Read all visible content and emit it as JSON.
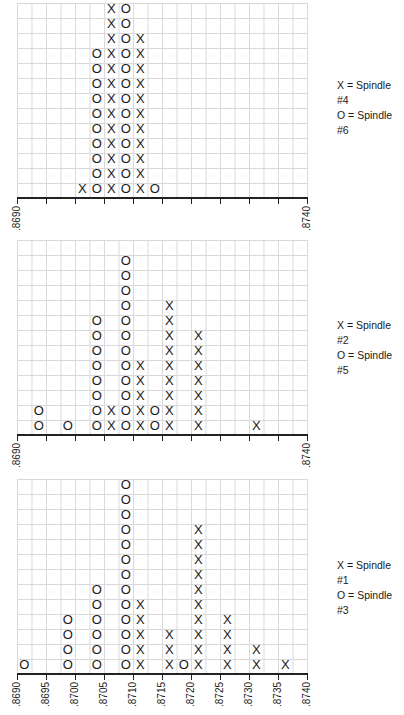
{
  "chart_data": [
    {
      "type": "scatter",
      "subtype": "dot-plot (tally of X/O markers)",
      "xlabel": "",
      "ylabel": "",
      "xlim": [
        0.869,
        0.874
      ],
      "bin_width": 0.00025,
      "legend_position": "right",
      "grid": true,
      "tick_labels": [
        ".8690",
        ".8740"
      ],
      "series": [
        {
          "name": "X = Spindle #4",
          "marker": "X",
          "bins": [
            0.8701,
            0.87065,
            0.87115
          ],
          "counts": [
            1,
            13,
            11
          ],
          "columns": [
            4,
            6,
            8
          ]
        },
        {
          "name": "O = Spindle #6",
          "marker": "O",
          "bins": [
            0.87038,
            0.87088,
            0.87138
          ],
          "counts": [
            10,
            13,
            1
          ],
          "columns": [
            5,
            7,
            9
          ]
        }
      ]
    },
    {
      "type": "scatter",
      "subtype": "dot-plot (tally of X/O markers)",
      "xlabel": "",
      "ylabel": "",
      "xlim": [
        0.869,
        0.874
      ],
      "bin_width": 0.00025,
      "legend_position": "right",
      "grid": true,
      "tick_labels": [
        ".8690",
        ".8740"
      ],
      "series": [
        {
          "name": "X = Spindle #2",
          "marker": "X",
          "columns": [
            6,
            8,
            10,
            12,
            16
          ],
          "counts": [
            2,
            5,
            9,
            7,
            1
          ]
        },
        {
          "name": "O = Spindle #5",
          "marker": "O",
          "columns": [
            1,
            3,
            5,
            7,
            9
          ],
          "counts": [
            2,
            1,
            8,
            12,
            2
          ]
        }
      ]
    },
    {
      "type": "scatter",
      "subtype": "dot-plot (tally of X/O markers)",
      "xlabel": "",
      "ylabel": "",
      "xlim": [
        0.869,
        0.874
      ],
      "bin_width": 0.00025,
      "legend_position": "right",
      "grid": true,
      "tick_labels": [
        ".8690",
        ".8695",
        ".8700",
        ".8705",
        ".8710",
        ".8715",
        ".8720",
        ".8725",
        ".8730",
        ".8735",
        ".8740"
      ],
      "series": [
        {
          "name": "X = Spindle #1",
          "marker": "X",
          "columns": [
            8,
            10,
            12,
            14,
            16,
            18
          ],
          "counts": [
            5,
            3,
            10,
            4,
            2,
            1
          ]
        },
        {
          "name": "O = Spindle #3",
          "marker": "O",
          "columns": [
            0,
            3,
            5,
            7,
            11
          ],
          "counts": [
            1,
            4,
            6,
            13,
            1
          ]
        }
      ]
    }
  ],
  "charts": [
    {
      "legend": [
        "X = Spindle #4",
        "O = Spindle #6"
      ],
      "tick_labels": [
        ".8690",
        ".8740"
      ]
    },
    {
      "legend": [
        "X = Spindle #2",
        "O = Spindle #5"
      ],
      "tick_labels": [
        ".8690",
        ".8740"
      ]
    },
    {
      "legend": [
        "X = Spindle #1",
        "O = Spindle #3"
      ],
      "tick_labels": [
        ".8690",
        ".8695",
        ".8700",
        ".8705",
        ".8710",
        ".8715",
        ".8720",
        ".8725",
        ".8730",
        ".8735",
        ".8740"
      ]
    }
  ]
}
